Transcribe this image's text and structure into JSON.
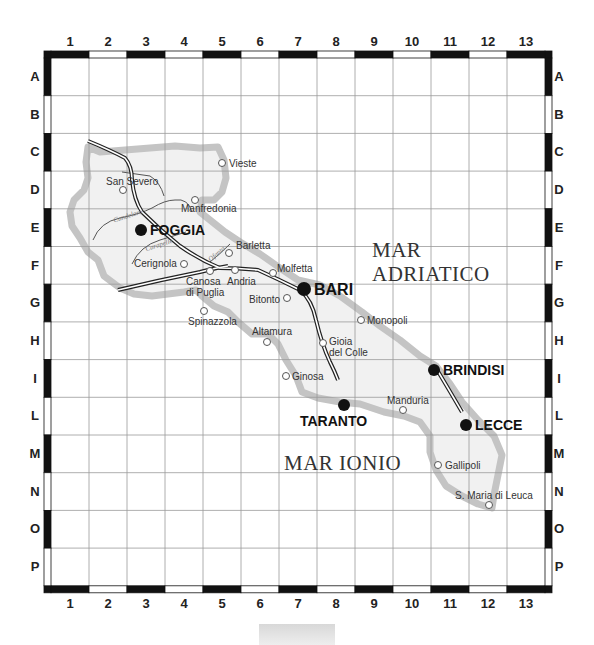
{
  "map": {
    "region": "Puglia",
    "columns": [
      "1",
      "2",
      "3",
      "4",
      "5",
      "6",
      "7",
      "8",
      "9",
      "10",
      "11",
      "12",
      "13"
    ],
    "rows": [
      "A",
      "B",
      "C",
      "D",
      "E",
      "F",
      "G",
      "H",
      "I",
      "L",
      "M",
      "N",
      "O",
      "P"
    ],
    "seas": [
      {
        "lines": [
          "MAR",
          "ADRIATICO"
        ],
        "id": "mar-adriatico"
      },
      {
        "lines": [
          "MAR IONIO"
        ],
        "id": "mar-ionio"
      }
    ],
    "rivers": [
      {
        "name": "Candelaro",
        "id": "candelaro"
      },
      {
        "name": "Carapelle",
        "id": "carapelle"
      },
      {
        "name": "Ofanto",
        "id": "ofanto"
      }
    ],
    "major_cities": {
      "foggia": "FOGGIA",
      "bari": "BARI",
      "taranto": "TARANTO",
      "brindisi": "BRINDISI",
      "lecce": "LECCE"
    },
    "towns": {
      "vieste": "Vieste",
      "san_severo": "San Severo",
      "manfredonia": "Manfredonia",
      "cerignola": "Cerignola",
      "barletta": "Barletta",
      "canosa_1": "Canosa",
      "canosa_2": "di Puglia",
      "andria": "Andria",
      "molfetta": "Molfetta",
      "bitonto": "Bitonto",
      "spinazzola": "Spinazzola",
      "altamura": "Altamura",
      "gioia_1": "Gioia",
      "gioia_2": "del Colle",
      "monopoli": "Monopoli",
      "ginosa": "Ginosa",
      "manduria": "Manduria",
      "gallipoli": "Gallipoli",
      "leuca": "S. Maria di Leuca"
    },
    "colors": {
      "frame_dark": "#111111",
      "grid_line": "#9a9a9a",
      "land_fill": "#f1f1f1",
      "coast": "#c4c4c4",
      "road": "#222222",
      "river": "#555555"
    }
  }
}
